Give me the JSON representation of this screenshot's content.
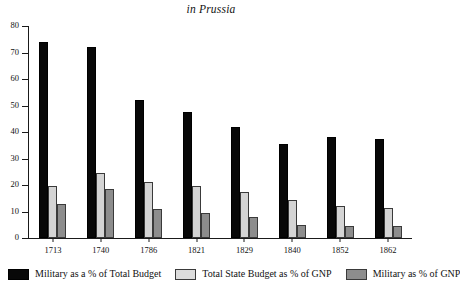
{
  "chart_data": {
    "type": "bar",
    "title": "in Prussia",
    "xlabel": "",
    "ylabel": "",
    "ylim": [
      0,
      80
    ],
    "yticks": [
      0,
      10,
      20,
      30,
      40,
      50,
      60,
      70,
      80
    ],
    "grid": false,
    "legend_position": "bottom",
    "categories": [
      "1713",
      "1740",
      "1786",
      "1821",
      "1829",
      "1840",
      "1852",
      "1862"
    ],
    "series": [
      {
        "name": "Military as a % of Total Budget",
        "color": "#080808",
        "values": [
          74,
          72,
          52,
          47.5,
          42,
          35.5,
          38,
          37.5
        ]
      },
      {
        "name": "Total State Budget as % of GNP",
        "color": "#d4d4d4",
        "values": [
          19.5,
          24.5,
          21,
          19.5,
          17.5,
          14.5,
          12,
          11.5
        ]
      },
      {
        "name": "Military as % of GNP",
        "color": "#8d8d8d",
        "values": [
          13,
          18.5,
          11,
          9.5,
          8,
          5,
          4.5,
          4.5
        ]
      }
    ]
  },
  "axis": {
    "y_tick_labels": [
      "0",
      "10",
      "20",
      "30",
      "40",
      "50",
      "60",
      "70",
      "80"
    ]
  }
}
